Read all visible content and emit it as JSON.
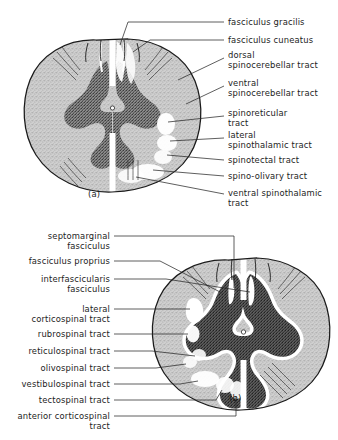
{
  "figure": {
    "panels": [
      {
        "id": "a",
        "caption": "(a)",
        "caption_x": 88,
        "caption_y": 193,
        "labels": [
          {
            "text": "fasciculus gracilis",
            "x": 228,
            "y": 22,
            "lines": 1
          },
          {
            "text": "fasciculus cuneatus",
            "x": 228,
            "y": 40,
            "lines": 1
          },
          {
            "text": "dorsal\nspinocerebellar tract",
            "x": 228,
            "y": 55,
            "lines": 2
          },
          {
            "text": "ventral\nspinocerebellar tract",
            "x": 228,
            "y": 83,
            "lines": 2
          },
          {
            "text": "spinoreticular\ntract",
            "x": 228,
            "y": 112,
            "lines": 2
          },
          {
            "text": "lateral\nspinothalamic tract",
            "x": 228,
            "y": 134,
            "lines": 2
          },
          {
            "text": "spinotectal tract",
            "x": 228,
            "y": 158,
            "lines": 1
          },
          {
            "text": "spino-olivary tract",
            "x": 228,
            "y": 174,
            "lines": 1
          },
          {
            "text": "ventral spinothalamic\ntract",
            "x": 228,
            "y": 190,
            "lines": 2
          }
        ]
      },
      {
        "id": "b",
        "caption": "(b)",
        "caption_x": 229,
        "caption_y": 397,
        "labels": [
          {
            "text": "septomarginal\nfasciculus",
            "x": 10,
            "y": 232,
            "lines": 2
          },
          {
            "text": "fasciculus proprius",
            "x": 10,
            "y": 257,
            "lines": 1
          },
          {
            "text": "interfascicularis\nfasciculus",
            "x": 10,
            "y": 275,
            "lines": 2
          },
          {
            "text": "lateral\ncorticospinal tract",
            "x": 10,
            "y": 305,
            "lines": 2
          },
          {
            "text": "rubrospinal tract",
            "x": 10,
            "y": 330,
            "lines": 1
          },
          {
            "text": "reticulospinal tract",
            "x": 10,
            "y": 347,
            "lines": 1
          },
          {
            "text": "olivospinal tract",
            "x": 10,
            "y": 364,
            "lines": 1
          },
          {
            "text": "vestibulospinal tract",
            "x": 10,
            "y": 380,
            "lines": 1
          },
          {
            "text": "tectospinal tract",
            "x": 10,
            "y": 396,
            "lines": 1
          },
          {
            "text": "anterior corticospinal\ntract",
            "x": 10,
            "y": 412,
            "lines": 2
          }
        ]
      }
    ]
  },
  "colors": {
    "background": "#ffffff",
    "outline": "#1a1a1a",
    "white_matter": "#b9b9b9",
    "gray_matter": "#4a4a4a",
    "gray_matter_dark": "#3a3a3a",
    "tract_highlight": "#ffffff",
    "leader_line": "#2a2a2a",
    "text": "#1c1c1c"
  }
}
